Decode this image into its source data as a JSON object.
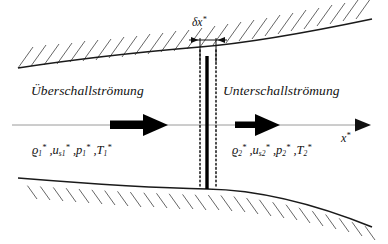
{
  "figure": {
    "type": "schematic",
    "language": "de"
  },
  "regions": {
    "upstream_label": "Überschallströmung",
    "downstream_label": "Unterschallströmung"
  },
  "state_upstream": {
    "density_sym": "ϱ",
    "density_sub": "1",
    "density_sup": "*",
    "velocity_sym": "u",
    "velocity_sub": "s1",
    "velocity_sup": "*",
    "pressure_sym": "p",
    "pressure_sub": "1",
    "pressure_sup": "*",
    "temperature_sym": "T",
    "temperature_sub": "1",
    "temperature_sup": "*",
    "separator": " ,"
  },
  "state_downstream": {
    "density_sym": "ϱ",
    "density_sub": "2",
    "density_sup": "*",
    "velocity_sym": "u",
    "velocity_sub": "s2",
    "velocity_sup": "*",
    "pressure_sym": "p",
    "pressure_sub": "2",
    "pressure_sup": "*",
    "temperature_sym": "T",
    "temperature_sub": "2",
    "temperature_sup": "*",
    "separator": " ,"
  },
  "axis": {
    "label_sym": "x",
    "label_sup": "*"
  },
  "dimension": {
    "label_sym": "δx",
    "label_sup": "*",
    "meaning": "shock-thickness"
  },
  "icons": {
    "flow_arrow_upstream": "flow-arrow-right-long",
    "flow_arrow_downstream": "flow-arrow-right-short",
    "axis_arrow": "axis-arrow-right"
  },
  "colors": {
    "ink": "#111111",
    "wall": "#1a1a1a",
    "hatch": "#555555",
    "centerline": "#9a9a9a",
    "shock": "#000000",
    "background": "#ffffff"
  },
  "geometry": {
    "shock_x": 207,
    "shock_top_y": 57,
    "shock_bottom_y": 189,
    "dotted_left_x": 200,
    "dotted_right_x": 216,
    "centerline_y": 125,
    "upper_wall": "M18,68 C70,60 140,52 200,47 C250,43 310,32 372,19",
    "lower_wall": "M18,178 C80,183 150,188 207,189 C265,190 320,206 372,227"
  }
}
